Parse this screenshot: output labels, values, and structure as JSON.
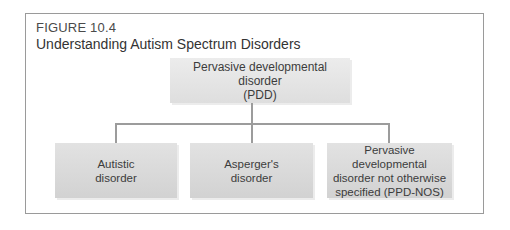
{
  "figure": {
    "label": "FIGURE 10.4",
    "title": "Understanding Autism Spectrum Disorders"
  },
  "diagram": {
    "root": {
      "line1": "Pervasive developmental disorder",
      "line2": "(PDD)"
    },
    "children": [
      {
        "line1": "Autistic",
        "line2": "disorder"
      },
      {
        "line1": "Asperger's",
        "line2": "disorder"
      },
      {
        "line1": "Pervasive developmental",
        "line2": "disorder not otherwise",
        "line3": "specified (PPD-NOS)"
      }
    ]
  },
  "colors": {
    "frame": "#9a9a9a",
    "box_fill": "#d8d8d8",
    "connector": "#9c9c9c",
    "text": "#3a3a3a"
  }
}
